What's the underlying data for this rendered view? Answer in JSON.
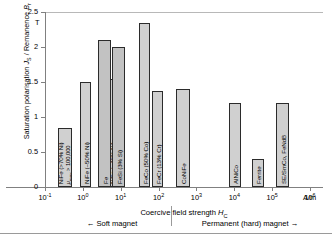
{
  "chart_data": {
    "type": "bar",
    "title": "",
    "xlabel": "Coercive field strength H_C",
    "xunit": "A/m",
    "ylabel": "Saturation polarisation J_S / Remanence B_r",
    "yunit": "T",
    "ylim": [
      0,
      2.5
    ],
    "ytick_labels": [
      "0",
      "0.5",
      "1",
      "1.5",
      "2",
      "2.5"
    ],
    "ytick_values": [
      0,
      0.5,
      1,
      1.5,
      2,
      2.5
    ],
    "xtick_labels": [
      "10-1",
      "100",
      "101",
      "102",
      "103",
      "104",
      "105",
      "106"
    ],
    "xtick_exponents": [
      "-1",
      "0",
      "1",
      "2",
      "3",
      "4",
      "5",
      "6"
    ],
    "x_log_scale": true,
    "grid": false,
    "legend": "none",
    "categories": [
      "NiFe (>70% Ni)",
      "NiFe (~50% Ni)",
      "NiFe (~40% Ni)",
      "Fe",
      "FeSi (3% Si)",
      "FeCo (50% Co)",
      "FeCr (13% Cr)",
      "CoNiFe",
      "AlNiCo",
      "Ferrite",
      "SE/SmCo, FeNdB"
    ],
    "values": [
      0.85,
      1.5,
      1.55,
      2.1,
      2.0,
      2.35,
      1.37,
      1.4,
      1.2,
      0.4,
      1.2
    ],
    "x_positions": [
      0.6,
      1.35,
      1.95,
      2.0,
      2.25,
      2.65,
      2.9,
      3.45,
      5.1,
      5.6,
      6.1
    ],
    "bars": [
      {
        "label": "NiFe (>70% Ni)",
        "sublabel": "μmax > 100,000",
        "value": 0.85,
        "left": 58,
        "width": 14,
        "nested": false
      },
      {
        "label": "NiFe (~50% Ni)",
        "sublabel": "",
        "value": 1.5,
        "left": 80,
        "width": 11,
        "nested": false
      },
      {
        "label": "NiFe (~40% Ni)",
        "sublabel": "",
        "value": 1.55,
        "left": 98,
        "width": 27,
        "nested": false
      },
      {
        "label": "Fe",
        "sublabel": "",
        "value": 2.1,
        "left": 98,
        "width": 13,
        "nested": true
      },
      {
        "label": "FeSi (3% Si)",
        "sublabel": "",
        "value": 2.0,
        "left": 112,
        "width": 13,
        "nested": true
      },
      {
        "label": "FeCo (50% Co)",
        "sublabel": "",
        "value": 2.35,
        "left": 139,
        "width": 11,
        "nested": false
      },
      {
        "label": "FeCr (13% Cr)",
        "sublabel": "",
        "value": 1.37,
        "left": 152,
        "width": 11,
        "nested": false
      },
      {
        "label": "CoNiFe",
        "sublabel": "",
        "value": 1.4,
        "left": 176,
        "width": 14,
        "nested": false
      },
      {
        "label": "AlNiCo",
        "sublabel": "",
        "value": 1.2,
        "left": 229,
        "width": 12,
        "nested": false
      },
      {
        "label": "Ferrite",
        "sublabel": "",
        "value": 0.4,
        "left": 252,
        "width": 12,
        "nested": false
      },
      {
        "label": "SE/SmCo, FeNdB",
        "sublabel": "",
        "value": 1.2,
        "left": 276,
        "width": 13,
        "nested": false
      }
    ],
    "annotations": {
      "soft_magnet": "← Soft magnet",
      "hard_magnet": "Permanent (hard) magnet →"
    }
  }
}
